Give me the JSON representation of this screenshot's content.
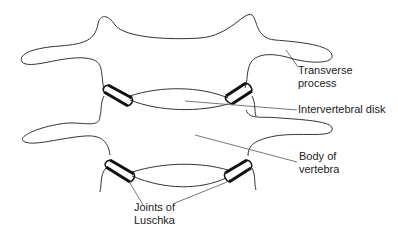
{
  "diagram": {
    "type": "anatomical-line-drawing",
    "labels": {
      "transverse_process_line1": "Transverse",
      "transverse_process_line2": "process",
      "intervertebral_disk": "Intervertebral disk",
      "body_of_vertebra_line1": "Body of",
      "body_of_vertebra_line2": "vertebra",
      "joints_of_luschka_line1": "Joints of",
      "joints_of_luschka_line2": "Luschka"
    },
    "colors": {
      "outline": "#333333",
      "joint": "#111111",
      "leader": "#555555",
      "background": "#ffffff"
    }
  }
}
